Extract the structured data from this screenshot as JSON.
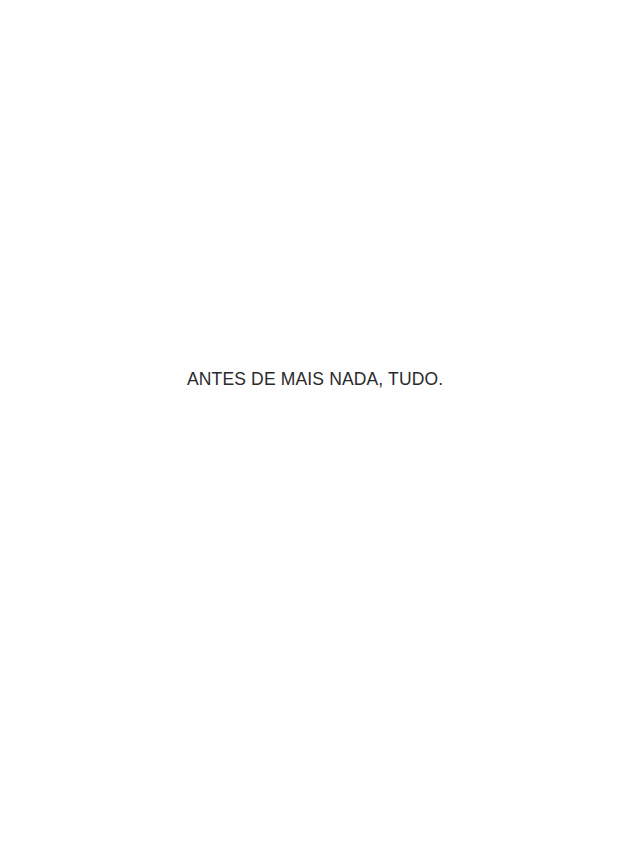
{
  "page": {
    "background": "#fefefe",
    "text_color": "#2a2a2a",
    "epigraph": "ANTES DE MAIS NADA, TUDO."
  }
}
